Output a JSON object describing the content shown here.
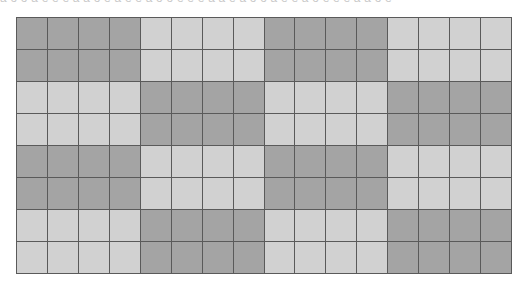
{
  "header": {
    "clipped_text": "a o o a e e e a a o e a e e a o o e e e a a e a o o a e e a o e e e a a o e"
  },
  "grid": {
    "rows": 8,
    "cols": 16,
    "block_rows": 2,
    "block_cols": 4,
    "colors": {
      "dark": "#a4a4a4",
      "light": "#d1d1d1",
      "line": "#5a5a5a"
    },
    "pattern": [
      "DDDDLLLLDDDDLLLL",
      "DDDDLLLLDDDDLLLL",
      "LLLLDDDDLLLLDDDD",
      "LLLLDDDDLLLLDDDD",
      "DDDDLLLLDDDDLLLL",
      "DDDDLLLLDDDDLLLL",
      "LLLLDDDDLLLLDDDD",
      "LLLLDDDDLLLLDDDD"
    ]
  }
}
